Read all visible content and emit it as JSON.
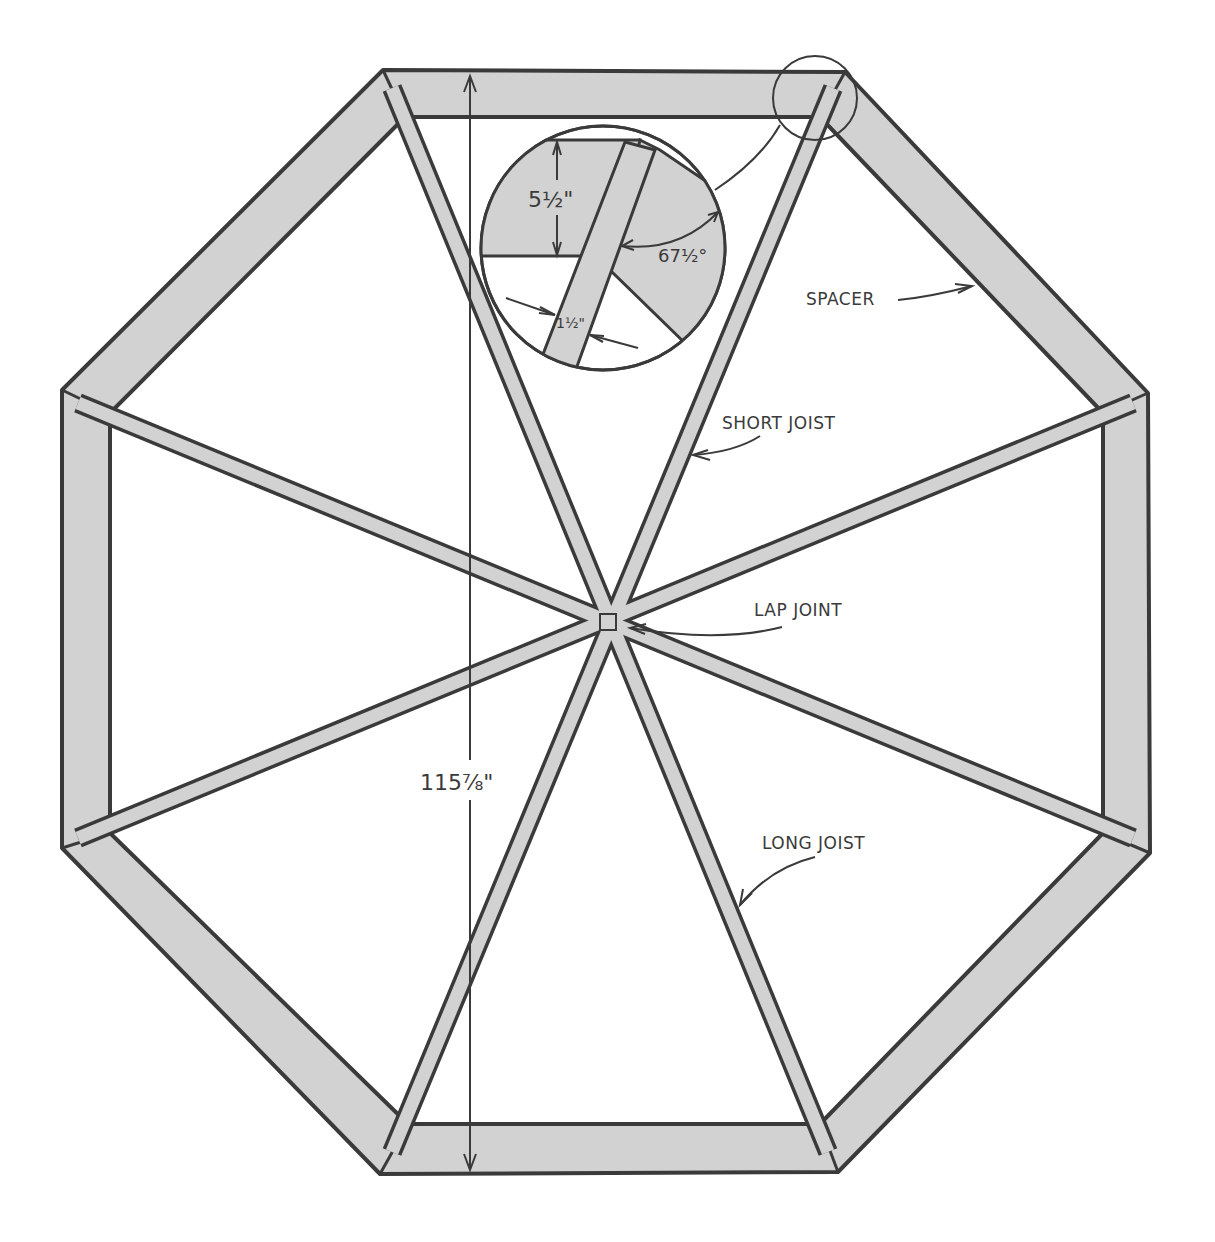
{
  "diagram": {
    "type": "octagonal deck frame plan",
    "colors": {
      "lumber_fill": "#d2d2d2",
      "line": "#3a3a3a",
      "background": "#ffffff"
    },
    "labels": {
      "spacer": "SPACER",
      "short_joist": "SHORT JOIST",
      "lap_joint": "LAP JOINT",
      "long_joist": "LONG JOIST"
    },
    "dimensions": {
      "overall_width": "115⅞\"",
      "board_depth": "5½\"",
      "board_thickness": "1½\"",
      "miter_angle": "67½°"
    },
    "detail_callout": "corner joint detail (magnified)"
  }
}
